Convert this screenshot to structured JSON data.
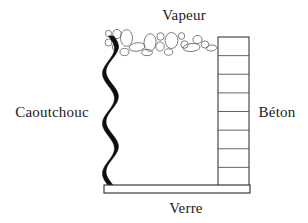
{
  "figure": {
    "type": "technical-cross-section-diagram",
    "language": "fr",
    "background_color": "#ffffff",
    "ink_color": "#1b1b1b",
    "width": 308,
    "height": 223
  },
  "labels": {
    "top": "Vapeur",
    "left": "Caoutchouc",
    "right": "Béton",
    "bottom": "Verre"
  },
  "materials": [
    {
      "name": "Vapeur",
      "role": "vapour-layer",
      "position": "top"
    },
    {
      "name": "Caoutchouc",
      "role": "rubber-seal",
      "position": "left"
    },
    {
      "name": "Béton",
      "role": "concrete-block-column",
      "position": "right"
    },
    {
      "name": "Verre",
      "role": "glass-substrate",
      "position": "bottom"
    }
  ],
  "geometry": {
    "chamber": {
      "x": 104,
      "y": 36,
      "width": 146,
      "height": 150
    },
    "rubber_band": {
      "x_min": 103,
      "x_max": 116,
      "y_top": 36,
      "y_bottom": 186,
      "wave_count": 3,
      "fill": "#0d0d0d"
    },
    "glass_bar": {
      "x": 104,
      "y": 185,
      "width": 146,
      "height": 8,
      "hatch_angle_deg": 60,
      "hatch_spacing": 4,
      "stroke": "#2a2a2a"
    },
    "concrete_column": {
      "x": 218,
      "y": 37,
      "width": 31,
      "height": 149,
      "cell_count": 8,
      "stroke": "#3a3a3a"
    },
    "vapour_band": {
      "x": 104,
      "y": 27,
      "width": 130,
      "height": 28
    }
  },
  "bubbles": [
    {
      "cx": 108.5,
      "cy": 33.5,
      "rx": 3.0,
      "ry": 3.2,
      "rot": 0
    },
    {
      "cx": 108.5,
      "cy": 42.5,
      "rx": 3.4,
      "ry": 3.6,
      "rot": 0
    },
    {
      "cx": 117.0,
      "cy": 34.0,
      "rx": 4.2,
      "ry": 4.6,
      "rot": 0
    },
    {
      "cx": 115.5,
      "cy": 47.0,
      "rx": 3.2,
      "ry": 3.4,
      "rot": 0
    },
    {
      "cx": 126.5,
      "cy": 38.0,
      "rx": 6.0,
      "ry": 8.4,
      "rot": 0
    },
    {
      "cx": 124.5,
      "cy": 52.0,
      "rx": 4.5,
      "ry": 3.6,
      "rot": 0
    },
    {
      "cx": 137.0,
      "cy": 47.0,
      "rx": 8.0,
      "ry": 4.2,
      "rot": -8
    },
    {
      "cx": 150.0,
      "cy": 42.5,
      "rx": 6.0,
      "ry": 8.8,
      "rot": 4
    },
    {
      "cx": 147.0,
      "cy": 52.5,
      "rx": 5.5,
      "ry": 3.2,
      "rot": 0
    },
    {
      "cx": 160.5,
      "cy": 36.5,
      "rx": 3.6,
      "ry": 3.8,
      "rot": 0
    },
    {
      "cx": 160.0,
      "cy": 46.5,
      "rx": 4.2,
      "ry": 4.6,
      "rot": 0
    },
    {
      "cx": 171.5,
      "cy": 40.5,
      "rx": 6.4,
      "ry": 8.0,
      "rot": 0
    },
    {
      "cx": 168.5,
      "cy": 52.0,
      "rx": 4.2,
      "ry": 3.2,
      "rot": 0
    },
    {
      "cx": 181.5,
      "cy": 36.0,
      "rx": 3.2,
      "ry": 3.4,
      "rot": 0
    },
    {
      "cx": 184.5,
      "cy": 44.5,
      "rx": 3.6,
      "ry": 3.8,
      "rot": 0
    },
    {
      "cx": 191.5,
      "cy": 47.5,
      "rx": 8.5,
      "ry": 4.0,
      "rot": -5
    },
    {
      "cx": 197.5,
      "cy": 39.5,
      "rx": 4.6,
      "ry": 4.0,
      "rot": 0
    },
    {
      "cx": 205.0,
      "cy": 44.5,
      "rx": 3.8,
      "ry": 3.6,
      "rot": 0
    },
    {
      "cx": 211.5,
      "cy": 48.0,
      "rx": 5.2,
      "ry": 3.0,
      "rot": -5
    }
  ],
  "label_positions": {
    "top": {
      "x": 184,
      "y": 20,
      "anchor": "middle"
    },
    "left": {
      "x": 52,
      "y": 117,
      "anchor": "middle"
    },
    "right": {
      "x": 277,
      "y": 117,
      "anchor": "middle"
    },
    "bottom": {
      "x": 186,
      "y": 213,
      "anchor": "middle"
    }
  }
}
